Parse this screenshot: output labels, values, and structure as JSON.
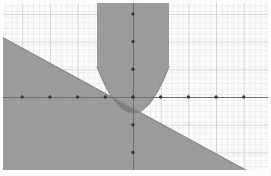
{
  "figure": {
    "title": "",
    "background_color": "#ffffff",
    "canvas": {
      "width": 271,
      "height": 176
    }
  },
  "chart_data": {
    "type": "scatter",
    "title": "",
    "subtitle": "",
    "xlabel": "",
    "ylabel": "",
    "grid": true,
    "grid_minor": true,
    "legend": "none",
    "axis": {
      "x_axis_visible": true,
      "y_axis_visible": true,
      "origin_units": [
        0,
        0
      ],
      "xlim": [
        -4.7,
        4.9
      ],
      "ylim": [
        -2.7,
        3.4
      ],
      "unit_px": 27.7,
      "major_gridline_step": 1,
      "minor_gridlines_per_major": 5,
      "x_tick_values": [
        -4,
        -3,
        -2,
        -1,
        0,
        1,
        2,
        3,
        4
      ],
      "y_tick_values": [
        -2,
        -1,
        0,
        1,
        2,
        3
      ],
      "tick_marker": "dot",
      "tick_labels_shown": false
    },
    "series": [
      {
        "name": "linear-inequality-region",
        "kind": "half-plane",
        "shape": "line",
        "relation": "y <= -0.545x - 0.42",
        "slope": -0.545,
        "intercept": -0.42,
        "shaded_side": "below",
        "fill_color": "#9a9a9a",
        "edge_color": "#8a8a8a",
        "endpoints_px": [
          [
            0,
            12
          ],
          [
            262,
            155
          ]
        ]
      },
      {
        "name": "parabola-inequality-region",
        "kind": "region",
        "shape": "parabola",
        "relation": "y >= 1.0x^2 - 0.02x - 0.58",
        "vertex_units": [
          0.0,
          -0.58
        ],
        "vertex_px": [
          133,
          113
        ],
        "opens": "up",
        "shaded_side": "inside",
        "fill_color": "#9a9a9a",
        "edge_color": "#8a8a8a",
        "top_edge_span_px": [
          101,
          168
        ]
      }
    ],
    "overlap_region": {
      "name": "solution-set",
      "fill_color": "#757575",
      "description": "intersection of both shaded inequality regions"
    },
    "colors": {
      "grid_minor": "#ececec",
      "grid_major": "#d8d8d8",
      "axis": "#6f6f6f",
      "tick_dot": "#3b3b3b",
      "shade_single": "#9a9a9a",
      "shade_overlap": "#757575",
      "background": "#ffffff"
    }
  }
}
